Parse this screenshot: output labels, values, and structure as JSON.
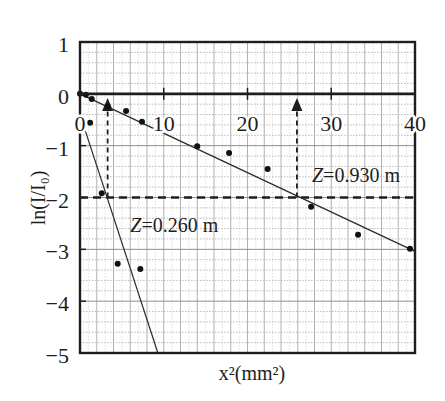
{
  "chart_data": {
    "type": "scatter",
    "title": "",
    "xlabel": "x²(mm²)",
    "ylabel": "ln(I/I₀)",
    "xlim": [
      0,
      40
    ],
    "ylim": [
      -5,
      1
    ],
    "xticks": [
      0,
      10,
      20,
      30,
      40
    ],
    "xtick_labels": [
      "0",
      "10",
      "20",
      "30",
      "40"
    ],
    "yticks": [
      1,
      0,
      -1,
      -2,
      -3,
      -4,
      -5
    ],
    "ytick_labels": [
      "1",
      "0",
      "−1",
      "−2",
      "−3",
      "−4",
      "−5"
    ],
    "grid": true,
    "legend": "none",
    "series": [
      {
        "name": "Z=0.930 m",
        "points": [
          [
            0,
            0
          ],
          [
            0.7,
            -0.02
          ],
          [
            1.4,
            -0.1
          ],
          [
            3.3,
            -0.25
          ],
          [
            5.5,
            -0.33
          ],
          [
            7.4,
            -0.54
          ],
          [
            14.0,
            -1.01
          ],
          [
            17.8,
            -1.14
          ],
          [
            22.4,
            -1.45
          ],
          [
            27.6,
            -2.18
          ],
          [
            33.2,
            -2.72
          ],
          [
            39.4,
            -2.99
          ]
        ],
        "fit_line": [
          [
            0,
            0
          ],
          [
            40,
            -3.04
          ]
        ]
      },
      {
        "name": "Z=0.260 m",
        "points": [
          [
            1.2,
            -0.56
          ],
          [
            2.6,
            -1.92
          ],
          [
            4.5,
            -3.28
          ],
          [
            7.2,
            -3.38
          ]
        ],
        "fit_line": [
          [
            0.55,
            -0.67
          ],
          [
            9.3,
            -5
          ]
        ]
      }
    ],
    "reference_line": {
      "style": "dashed",
      "y": -2
    },
    "arrows": [
      {
        "x": 3.3,
        "from_y": -2,
        "to_y": -0.08
      },
      {
        "x": 25.9,
        "from_y": -2,
        "to_y": -0.08
      }
    ],
    "annotations": [
      {
        "var": "Z",
        "rest": "=0.930 m",
        "x": 27.7,
        "y": -1.7
      },
      {
        "var": "Z",
        "rest": "=0.260 m",
        "x": 6.0,
        "y": -2.67
      }
    ],
    "colors": {
      "ink": "#1e1e1e",
      "grid": "#a8a8a8",
      "background": "#ffffff"
    }
  }
}
